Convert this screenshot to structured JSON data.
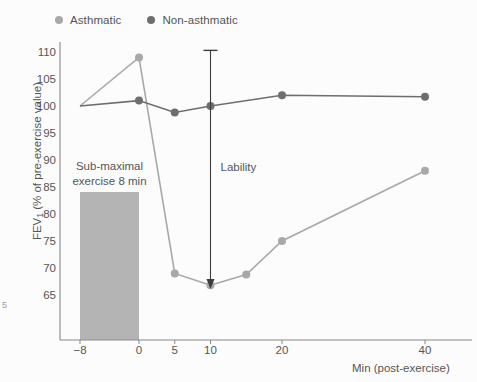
{
  "chart_data": {
    "type": "line",
    "title": "",
    "xlabel": "Min (post-exercise)",
    "ylabel": "FEV₁ (% of pre-exercise value)",
    "ylabel_main": "FEV",
    "ylabel_sub": "1",
    "ylabel_rest": " (% of pre-exercise value)",
    "xtick_labels": [
      "−8",
      "0",
      "5",
      "10",
      "20",
      "40"
    ],
    "xtick_values": [
      -8,
      0,
      5,
      10,
      20,
      40
    ],
    "ytick_labels": [
      "65",
      "70",
      "75",
      "80",
      "85",
      "90",
      "95",
      "100",
      "105",
      "110"
    ],
    "ytick_values": [
      65,
      70,
      75,
      80,
      85,
      90,
      95,
      100,
      105,
      110
    ],
    "ylim": [
      62,
      112
    ],
    "xlim": [
      -11,
      44
    ],
    "grid": false,
    "legend_position": "top-left",
    "series": [
      {
        "name": "Asthmatic",
        "color": "#a8a8a8",
        "x": [
          -8,
          0,
          5,
          10,
          15,
          20,
          40
        ],
        "y": [
          100,
          109,
          69,
          66.8,
          68.8,
          75,
          88
        ]
      },
      {
        "name": "Non-asthmatic",
        "color": "#6e6e6e",
        "x": [
          -8,
          0,
          5,
          10,
          20,
          40
        ],
        "y": [
          100,
          101,
          98.8,
          100,
          102,
          101.7
        ]
      }
    ],
    "annotations": [
      {
        "name": "lability-arrow",
        "label": "Lability",
        "x": 10,
        "y_top": 110.3,
        "y_bottom": 66.3
      },
      {
        "name": "exercise-period",
        "label_line1": "Sub-maximal",
        "label_line2": "exercise 8 min",
        "x_start": -8,
        "x_end": 0,
        "y_top": 84,
        "y_bottom": 62,
        "color": "#b4b4b4"
      }
    ]
  },
  "legend": {
    "items": [
      {
        "label": "Asthmatic",
        "color": "#a8a8a8"
      },
      {
        "label": "Non-asthmatic",
        "color": "#6e6e6e"
      }
    ]
  },
  "margin_mark": "5"
}
